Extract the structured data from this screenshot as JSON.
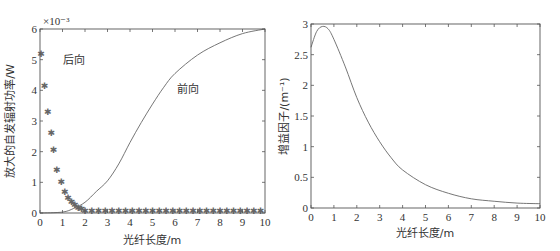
{
  "chart_data": [
    {
      "type": "line",
      "title": "",
      "xlabel": "光纤长度/m",
      "ylabel": "放大的自发辐射功率/W",
      "y_exponent_label": "×10⁻³",
      "xlim": [
        0,
        10
      ],
      "ylim": [
        0,
        6
      ],
      "x_ticks": [
        "0",
        "1",
        "2",
        "3",
        "4",
        "5",
        "6",
        "7",
        "8",
        "9",
        "10"
      ],
      "y_ticks": [
        "0",
        "1",
        "2",
        "3",
        "4",
        "5",
        "6"
      ],
      "grid": false,
      "annotations": [
        {
          "text": "后向",
          "x": 1.0,
          "y": 4.85
        },
        {
          "text": "前向",
          "x": 6.1,
          "y": 3.9
        }
      ],
      "series": [
        {
          "name": "前向",
          "style": "line",
          "x": [
            0,
            1,
            1.5,
            2,
            2.5,
            3,
            3.5,
            4,
            4.5,
            5,
            5.5,
            6,
            7,
            8,
            9,
            10
          ],
          "y": [
            0,
            0.03,
            0.15,
            0.35,
            0.7,
            1.05,
            1.6,
            2.3,
            2.95,
            3.55,
            4.1,
            4.55,
            5.15,
            5.55,
            5.85,
            6.0
          ]
        },
        {
          "name": "后向",
          "style": "marker",
          "x": [
            0.05,
            0.2,
            0.35,
            0.5,
            0.6,
            0.75,
            0.95,
            1.1,
            1.25,
            1.4,
            1.55,
            1.7,
            1.85,
            2.0,
            2.3,
            2.6,
            2.9,
            3.2,
            3.5,
            3.8,
            4.1,
            4.4,
            4.7,
            5.0,
            5.3,
            5.6,
            5.9,
            6.2,
            6.5,
            6.8,
            7.1,
            7.4,
            7.7,
            8.0,
            8.3,
            8.6,
            8.9,
            9.2,
            9.5,
            9.8
          ],
          "y": [
            5.2,
            4.15,
            3.3,
            2.6,
            2.05,
            1.4,
            1.0,
            0.7,
            0.5,
            0.35,
            0.25,
            0.17,
            0.12,
            0.08,
            0.06,
            0.05,
            0.05,
            0.05,
            0.05,
            0.05,
            0.05,
            0.05,
            0.05,
            0.05,
            0.05,
            0.05,
            0.05,
            0.05,
            0.05,
            0.05,
            0.05,
            0.05,
            0.05,
            0.05,
            0.05,
            0.05,
            0.05,
            0.05,
            0.05,
            0.05
          ]
        }
      ]
    },
    {
      "type": "line",
      "title": "",
      "xlabel": "光纤长度/m",
      "ylabel": "增益因子/(m⁻¹)",
      "xlim": [
        0,
        10
      ],
      "ylim": [
        0,
        3
      ],
      "x_ticks": [
        "0",
        "1",
        "2",
        "3",
        "4",
        "5",
        "6",
        "7",
        "8",
        "9",
        "10"
      ],
      "y_ticks": [
        "0",
        "0.5",
        "1",
        "1.5",
        "2",
        "2.5",
        "3"
      ],
      "grid": false,
      "series": [
        {
          "name": "增益因子",
          "style": "line",
          "x": [
            0,
            0.25,
            0.5,
            0.75,
            1,
            1.5,
            2,
            2.5,
            3,
            3.5,
            4,
            5,
            6,
            7,
            8,
            9,
            10
          ],
          "y": [
            2.62,
            2.88,
            2.96,
            2.92,
            2.75,
            2.3,
            1.8,
            1.4,
            1.08,
            0.82,
            0.62,
            0.38,
            0.24,
            0.15,
            0.11,
            0.08,
            0.07
          ]
        }
      ]
    }
  ]
}
